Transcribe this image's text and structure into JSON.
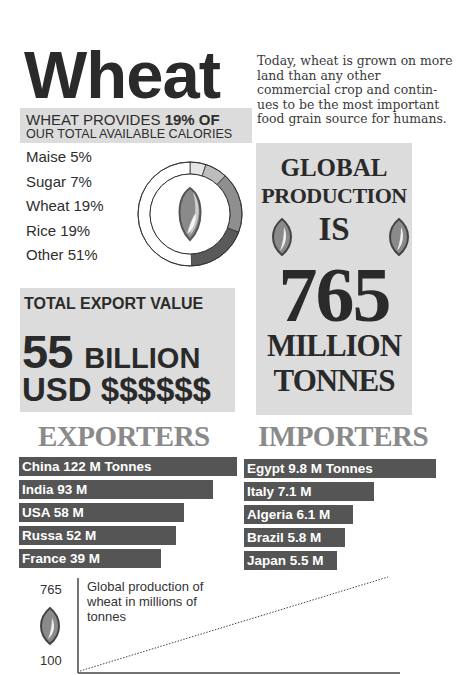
{
  "title": "Wheat",
  "intro": "Today, wheat is grown on more land than any other commercial crop and contin-ues to be the most important food grain source for humans.",
  "calories": {
    "line1_prefix": "WHEAT PROVIDES ",
    "line1_bold": "19% OF",
    "line2": "OUR  TOTAL  AVAILABLE CALORIES"
  },
  "chart_data": [
    {
      "type": "pie",
      "title": "Share of total available calories",
      "categories": [
        "Maise",
        "Sugar",
        "Wheat",
        "Rice",
        "Other"
      ],
      "values": [
        5,
        7,
        19,
        19,
        51
      ],
      "labels": [
        "Maise 5%",
        "Sugar 7%",
        "Wheat 19%",
        "Rice 19%",
        "Other 51%"
      ],
      "colors": [
        "#e6e6e6",
        "#bdbdbd",
        "#8f8f8f",
        "#5a5a5a",
        "#ffffff"
      ],
      "style": "donut"
    },
    {
      "type": "bar",
      "title": "EXPORTERS",
      "orientation": "horizontal",
      "categories": [
        "China",
        "India",
        "USA",
        "Russa",
        "France"
      ],
      "values": [
        122,
        93,
        58,
        52,
        39
      ],
      "unit": "M Tonnes"
    },
    {
      "type": "bar",
      "title": "IMPORTERS",
      "orientation": "horizontal",
      "categories": [
        "Egypt",
        "Italy",
        "Algeria",
        "Brazil",
        "Japan"
      ],
      "values": [
        9.8,
        7.1,
        6.1,
        5.8,
        5.5
      ],
      "unit": "M Tonnes"
    },
    {
      "type": "line",
      "title": "Global production of wheat in millions of tonnes",
      "ylim": [
        100,
        765
      ],
      "y_ticks": [
        100,
        765
      ],
      "x": [
        0,
        1
      ],
      "values": [
        100,
        765
      ],
      "line_style": "dotted"
    }
  ],
  "legend": [
    "Maise 5%",
    "Sugar 7%",
    "Wheat 19%",
    "Rice 19%",
    "Other 51%"
  ],
  "export_value": {
    "title": "TOTAL EXPORT VALUE",
    "amount": "55",
    "unit": "BILLION",
    "currency_line": "USD $$$$$$"
  },
  "production": {
    "line1": "GLOBAL",
    "line2": "PRODUCTION",
    "line3": "IS",
    "number": "765",
    "line4": "MILLION",
    "line5": "TONNES"
  },
  "exporters": {
    "title": "EXPORTERS",
    "items": [
      {
        "label": "China 122 M Tonnes",
        "width": 218
      },
      {
        "label": "India 93 M",
        "width": 194
      },
      {
        "label": "USA 58 M",
        "width": 165
      },
      {
        "label": "Russa 52 M",
        "width": 157
      },
      {
        "label": "France 39 M",
        "width": 142
      }
    ]
  },
  "importers": {
    "title": "IMPORTERS",
    "items": [
      {
        "label": "Egypt 9.8 M Tonnes",
        "width": 192
      },
      {
        "label": "Italy 7.1 M",
        "width": 130
      },
      {
        "label": "Algeria 6.1 M",
        "width": 109
      },
      {
        "label": "Brazil 5.8 M",
        "width": 101
      },
      {
        "label": "Japan 5.5 M",
        "width": 93
      }
    ]
  },
  "line_chart": {
    "y_max_label": "765",
    "y_min_label": "100",
    "caption": "Global production of wheat in millions of tonnes"
  },
  "colors": {
    "box_gray": "#dcdcdc",
    "bar_dark": "#555555",
    "heading_gray": "#8a8a8a",
    "text_dark": "#2a2a2a"
  }
}
